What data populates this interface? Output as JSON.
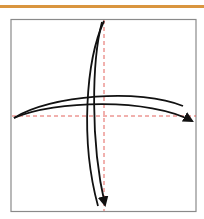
{
  "diagram": {
    "title": "",
    "accent_bar_color": "#d9953f",
    "frame_color": "#8a8a8a",
    "guide_color": "#e0504a",
    "stroke_color": "#111111",
    "elements": [
      {
        "type": "frame",
        "label": "square"
      },
      {
        "type": "guide",
        "orientation": "vertical",
        "style": "dashed"
      },
      {
        "type": "guide",
        "orientation": "horizontal",
        "style": "dashed"
      },
      {
        "type": "curved-arrow",
        "direction": "down",
        "label": "vertical curved arrow"
      },
      {
        "type": "curved-arrow",
        "direction": "right",
        "label": "horizontal curved arrow"
      }
    ]
  }
}
